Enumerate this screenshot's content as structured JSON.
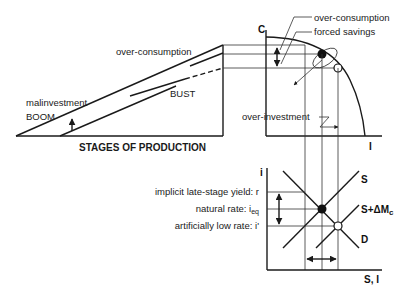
{
  "hayek_triangle": {
    "title": "STAGES OF PRODUCTION",
    "labels": {
      "over_consumption": "over-consumption",
      "bust": "BUST",
      "malinvestment": "malinvestment",
      "boom": "BOOM"
    }
  },
  "ppf": {
    "y_axis": "C",
    "x_axis": "I",
    "labels": {
      "over_consumption": "over-consumption",
      "forced_savings": "forced savings",
      "over_investment": "over-investment"
    }
  },
  "loanable_funds": {
    "y_axis": "i",
    "x_axis": "S, I",
    "curves": {
      "supply": "S",
      "supply_shifted": "S+ΔM",
      "supply_shifted_sub": "c",
      "demand": "D"
    },
    "rates": {
      "implicit": "implicit late-stage yield: r",
      "natural_prefix": "natural rate: i",
      "natural_sub": "eq",
      "artificial": "artificially low rate: i'"
    }
  },
  "colors": {
    "line": "#1a1a1a",
    "background": "#ffffff"
  }
}
